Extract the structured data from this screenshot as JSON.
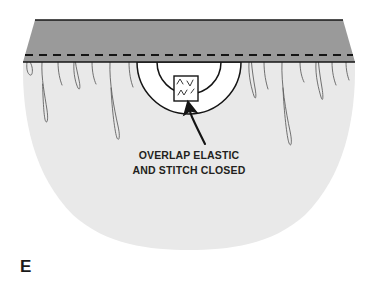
{
  "figure": {
    "kind": "sewing-instruction-illustration",
    "panel_label": "E",
    "callout": {
      "line1": "OVERLAP ELASTIC",
      "line2": "AND STITCH CLOSED"
    },
    "parts": {
      "waistband_label": "elastic casing waistband",
      "body_label": "gathered skirt body",
      "opening_label": "casing opening",
      "overlap_patch_label": "overlapped elastic ends",
      "stitch_line_label": "dashed stitching line",
      "arrow_label": "curved pointer arrow"
    },
    "colors": {
      "waistband_fill": "#9a9a9a",
      "body_fill": "#e9e9e9",
      "opening_fill": "#ffffff",
      "outline": "#1a1a1a",
      "fold_line": "#4a4a4a",
      "text": "#231f20",
      "background": "#ffffff"
    },
    "geometry": {
      "band_top_y": 20,
      "stitch_line_y": 55,
      "band_bottom_y": 62,
      "band_left_top_x": 35,
      "band_right_top_x": 343,
      "band_left_bottom_x": 23,
      "band_right_bottom_x": 355,
      "body_bottom_y": 243,
      "opening_center_x": 189,
      "opening_outer_r": 52,
      "opening_inner_r": 32
    },
    "fold_count_left": 8,
    "fold_count_right": 8,
    "dash_segments": 26
  }
}
